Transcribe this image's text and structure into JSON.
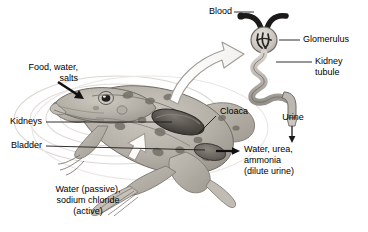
{
  "figure": {
    "background_color": "#ffffff",
    "text_color": "#000000",
    "line_color": "#1a1a1a"
  },
  "labels": {
    "food_water_salts": {
      "line1": "Food, water,",
      "line2": "salts"
    },
    "kidneys": "Kidneys",
    "bladder": "Bladder",
    "water_sodium": {
      "line1": "Water (passive),",
      "line2": "sodium chloride",
      "line3": "(active)"
    },
    "cloaca": "Cloaca",
    "water_urea_ammonia": {
      "line1": "Water, urea,",
      "line2": "ammonia",
      "line3": "(dilute urine)"
    },
    "blood": "Blood",
    "glomerulus": "Glomerulus",
    "kidney_tubule": {
      "line1": "Kidney",
      "line2": "tubule"
    },
    "urine": "Urine"
  },
  "organism": {
    "name": "leopard-frog",
    "view": "dorsal",
    "body_color": "#b9b5ac",
    "spot_color": "#6f6a62",
    "kidney_color": "#4a4641"
  },
  "nephron": {
    "blood_vessel_color": "#1c1a18",
    "capsule_color": "#cfcbc4",
    "tubule_color": "#b6b2ab",
    "duct_color": "#a8a49d"
  },
  "arrows": {
    "intake": "black-arrow-into-mouth",
    "excretion": "black-arrow-from-cloaca",
    "skin_exchange": "white-block-arrow-skin",
    "callout": "white-curved-block-arrow-to-nephron",
    "urine_drop": "black-arrow-down-urine"
  }
}
